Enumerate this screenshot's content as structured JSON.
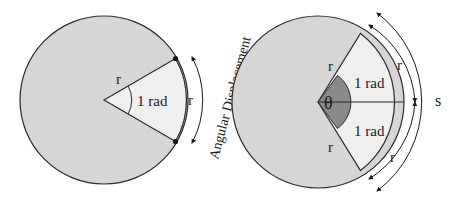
{
  "figure": {
    "left_panel": {
      "radius_label_edge": "r",
      "radius_label_arc": "r",
      "angle_label": "1 rad",
      "arc_caption": "Angular Displacement"
    },
    "right_panel": {
      "theta_label": "θ",
      "upper_sector_label": "1 rad",
      "lower_sector_label": "1 rad",
      "upper_radius_label": "r",
      "lower_radius_label": "r",
      "upper_arc_label": "r",
      "lower_arc_label": "r",
      "total_arc_label": "s"
    },
    "colors": {
      "circle_fill": "#d6d6d6",
      "sector_fill": "#efefef",
      "theta_fill": "#8a8a8a",
      "stroke": "#2a2a2a"
    }
  }
}
